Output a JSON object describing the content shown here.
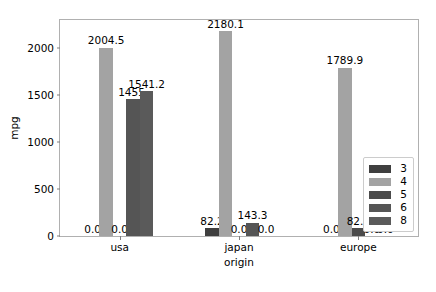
{
  "chart_data": {
    "type": "bar",
    "title": "",
    "subtitle": "",
    "xlabel": "origin",
    "ylabel": "mpg",
    "categories": [
      "usa",
      "japan",
      "europe"
    ],
    "ylim": [
      0,
      2300
    ],
    "yticks": [
      0,
      500,
      1000,
      1500,
      2000
    ],
    "ytick_labels": [
      "0",
      "500",
      "1000",
      "1500",
      "2000"
    ],
    "grid": false,
    "legend_title": "",
    "legend_position": "lower right",
    "series": [
      {
        "name": "3",
        "color": "#3f3f3f",
        "values": [
          0.0,
          82.2,
          0.0
        ],
        "labels": [
          "0.0",
          "82.2",
          "0.0"
        ]
      },
      {
        "name": "4",
        "color": "#a3a3a3",
        "values": [
          2004.5,
          2180.1,
          1789.9
        ],
        "labels": [
          "2004.5",
          "2180.1",
          "1789.9"
        ]
      },
      {
        "name": "5",
        "color": "#4b4b4b",
        "values": [
          0.0,
          0.0,
          82.1
        ],
        "labels": [
          "0.0",
          "0.0",
          "82.1"
        ]
      },
      {
        "name": "6",
        "color": "#555555",
        "values": [
          1455.0,
          143.3,
          0.0
        ],
        "labels": [
          "1455.",
          "143.3",
          "0.0"
        ]
      },
      {
        "name": "8",
        "color": "#5a5a5a",
        "values": [
          1541.2,
          0.0,
          0.0
        ],
        "labels": [
          "1541.2",
          "0.0",
          "0.0"
        ]
      }
    ]
  },
  "axes": {
    "ylabel": "mpg",
    "xlabel": "origin",
    "ytick_0": "0",
    "ytick_1": "500",
    "ytick_2": "1000",
    "ytick_3": "1500",
    "ytick_4": "2000",
    "xtick_0": "usa",
    "xtick_1": "japan",
    "xtick_2": "europe"
  },
  "legend": {
    "items": [
      {
        "label": "3",
        "color": "#3f3f3f"
      },
      {
        "label": "4",
        "color": "#a3a3a3"
      },
      {
        "label": "5",
        "color": "#4b4b4b"
      },
      {
        "label": "6",
        "color": "#555555"
      },
      {
        "label": "8",
        "color": "#5a5a5a"
      }
    ]
  }
}
